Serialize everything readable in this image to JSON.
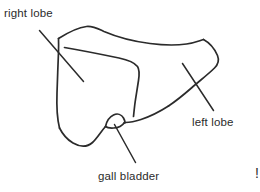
{
  "canvas": {
    "width": 260,
    "height": 192,
    "background_color": "#ffffff",
    "ink_color": "#2b2b2b"
  },
  "labels": {
    "right_lobe": "right lobe",
    "left_lobe": "left lobe",
    "gall_bladder": "gall bladder"
  },
  "edge_mark": {
    "text": "!"
  },
  "diagram": {
    "style": "hand-drawn black ink outline on white",
    "parts": [
      "liver-outline",
      "lobar-fissure",
      "gall-bladder-outline",
      "right-lobe-leader-line",
      "left-lobe-leader-line",
      "gall-bladder-leader-line"
    ]
  }
}
